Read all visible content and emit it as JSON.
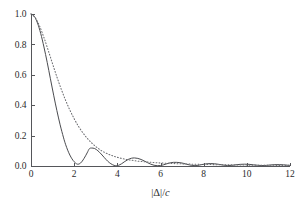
{
  "chart_data": {
    "type": "line",
    "title": "",
    "subtitle": "",
    "xlabel": "|Δ|/c",
    "xlabel_parts": {
      "prefix": "|Δ|/",
      "italic": "c"
    },
    "ylabel": "",
    "xlim": [
      0,
      12
    ],
    "ylim": [
      0.0,
      1.0
    ],
    "xticks": [
      0,
      2,
      4,
      6,
      8,
      10,
      12
    ],
    "xticklabels": [
      "0",
      "2",
      "4",
      "6",
      "8",
      "10",
      "12"
    ],
    "yticks": [
      0.0,
      0.2,
      0.4,
      0.6,
      0.8,
      1.0
    ],
    "yticklabels": [
      "0.0",
      "0.2",
      "0.4",
      "0.6",
      "0.8",
      "1.0"
    ],
    "grid": false,
    "legend": false,
    "legend_position": "none",
    "tick_direction": "in",
    "background_color": "#ffffff",
    "axis_color": "#55565a",
    "series": [
      {
        "name": "oscillating-decay",
        "style": "solid",
        "color": "#4a4b4f",
        "x": [
          0.0,
          0.15,
          0.3,
          0.45,
          0.6,
          0.75,
          0.9,
          1.05,
          1.2,
          1.35,
          1.5,
          1.6,
          1.7,
          1.8,
          1.9,
          2.0,
          2.15,
          2.3,
          2.45,
          2.6,
          2.7,
          2.8,
          2.95,
          3.1,
          3.25,
          3.4,
          3.55,
          3.7,
          3.85,
          3.95,
          4.05,
          4.2,
          4.35,
          4.5,
          4.65,
          4.8,
          4.95,
          5.1,
          5.25,
          5.4,
          5.55,
          5.7,
          5.85,
          6.0,
          6.15,
          6.3,
          6.45,
          6.6,
          6.75,
          6.9,
          7.05,
          7.2,
          7.35,
          7.5,
          7.7,
          7.9,
          8.1,
          8.3,
          8.5,
          8.7,
          8.9,
          9.1,
          9.3,
          9.5,
          9.7,
          9.9,
          10.1,
          10.3,
          10.5,
          10.7,
          10.9,
          11.1,
          11.3,
          11.5,
          11.7,
          11.9,
          12.0
        ],
        "y": [
          1.0,
          0.985,
          0.941,
          0.872,
          0.783,
          0.682,
          0.574,
          0.466,
          0.364,
          0.271,
          0.19,
          0.143,
          0.104,
          0.072,
          0.047,
          0.028,
          0.012,
          0.02,
          0.048,
          0.086,
          0.113,
          0.118,
          0.115,
          0.1,
          0.079,
          0.055,
          0.032,
          0.015,
          0.004,
          0.002,
          0.004,
          0.015,
          0.03,
          0.043,
          0.051,
          0.053,
          0.05,
          0.043,
          0.033,
          0.022,
          0.012,
          0.005,
          0.002,
          0.003,
          0.008,
          0.015,
          0.021,
          0.024,
          0.024,
          0.022,
          0.018,
          0.012,
          0.007,
          0.003,
          0.003,
          0.009,
          0.014,
          0.016,
          0.015,
          0.011,
          0.006,
          0.003,
          0.004,
          0.008,
          0.011,
          0.012,
          0.011,
          0.008,
          0.005,
          0.003,
          0.004,
          0.007,
          0.009,
          0.009,
          0.008,
          0.005,
          0.004
        ]
      },
      {
        "name": "monotonic-decay",
        "style": "dotted",
        "color": "#6d6e72",
        "x": [
          0.0,
          0.2,
          0.4,
          0.6,
          0.8,
          1.0,
          1.2,
          1.4,
          1.6,
          1.8,
          2.0,
          2.2,
          2.4,
          2.6,
          2.8,
          3.0,
          3.2,
          3.4,
          3.6,
          3.8,
          4.0,
          4.25,
          4.5,
          4.75,
          5.0,
          5.25,
          5.5,
          5.75,
          6.0,
          6.25,
          6.5,
          6.75,
          7.0,
          7.25,
          7.5,
          7.75,
          8.0,
          8.5,
          9.0,
          9.5,
          10.0,
          10.5,
          11.0,
          11.5,
          12.0
        ],
        "y": [
          1.0,
          0.975,
          0.92,
          0.845,
          0.76,
          0.672,
          0.586,
          0.506,
          0.433,
          0.368,
          0.311,
          0.261,
          0.219,
          0.183,
          0.153,
          0.128,
          0.107,
          0.09,
          0.077,
          0.066,
          0.057,
          0.048,
          0.041,
          0.036,
          0.031,
          0.028,
          0.025,
          0.022,
          0.02,
          0.018,
          0.017,
          0.015,
          0.014,
          0.013,
          0.012,
          0.011,
          0.01,
          0.009,
          0.008,
          0.007,
          0.006,
          0.005,
          0.005,
          0.004,
          0.004
        ]
      }
    ]
  },
  "figure": {
    "plot_left_px": 31,
    "plot_right_px": 290,
    "plot_top_px": 14,
    "plot_bottom_px": 166
  }
}
